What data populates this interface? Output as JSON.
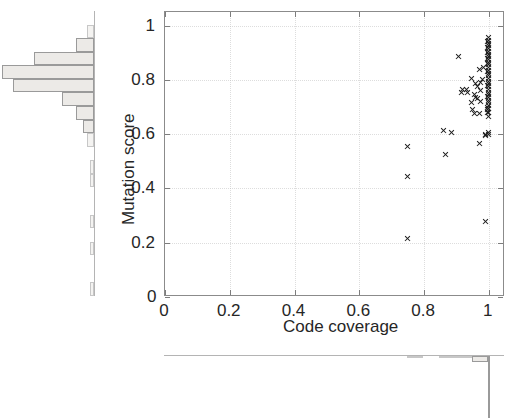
{
  "figure": {
    "name": "code-coverage-vs-mutation-score-scatter-with-marginal-histograms"
  },
  "chart_data": {
    "type": "scatter",
    "title": "",
    "xlabel": "Code coverage",
    "ylabel": "Mutation score",
    "xlim": [
      0,
      1.05
    ],
    "ylim": [
      0,
      1.05
    ],
    "grid": true,
    "legend": null,
    "xticks": [
      "0",
      "0.2",
      "0.4",
      "0.6",
      "0.8",
      "1"
    ],
    "xtick_values": [
      0,
      0.2,
      0.4,
      0.6,
      0.8,
      1
    ],
    "yticks": [
      "0",
      "0.2",
      "0.4",
      "0.6",
      "0.8",
      "1"
    ],
    "ytick_values": [
      0,
      0.2,
      0.4,
      0.6,
      0.8,
      1
    ],
    "marker": "x",
    "marker_color": "#1c1c1c",
    "points": [
      [
        0.75,
        0.215
      ],
      [
        0.75,
        0.445
      ],
      [
        0.75,
        0.555
      ],
      [
        0.865,
        0.525
      ],
      [
        0.86,
        0.615
      ],
      [
        0.885,
        0.605
      ],
      [
        0.905,
        0.885
      ],
      [
        0.92,
        0.765
      ],
      [
        0.915,
        0.755
      ],
      [
        0.93,
        0.765
      ],
      [
        0.935,
        0.755
      ],
      [
        0.945,
        0.805
      ],
      [
        0.945,
        0.715
      ],
      [
        0.95,
        0.69
      ],
      [
        0.955,
        0.675
      ],
      [
        0.955,
        0.745
      ],
      [
        0.96,
        0.735
      ],
      [
        0.96,
        0.785
      ],
      [
        0.965,
        0.775
      ],
      [
        0.965,
        0.73
      ],
      [
        0.97,
        0.84
      ],
      [
        0.97,
        0.675
      ],
      [
        0.97,
        0.565
      ],
      [
        0.975,
        0.79
      ],
      [
        0.975,
        0.76
      ],
      [
        0.975,
        0.72
      ],
      [
        0.98,
        0.8
      ],
      [
        0.985,
        0.845
      ],
      [
        0.99,
        0.6
      ],
      [
        0.99,
        0.595
      ],
      [
        0.99,
        0.28
      ],
      [
        0.995,
        0.68
      ],
      [
        0.995,
        0.69
      ],
      [
        1.0,
        0.6
      ],
      [
        1.0,
        0.605
      ],
      [
        1.0,
        0.665
      ],
      [
        1.0,
        0.68
      ],
      [
        1.0,
        0.695
      ],
      [
        1.0,
        0.705
      ],
      [
        1.0,
        0.715
      ],
      [
        1.0,
        0.725
      ],
      [
        1.0,
        0.735
      ],
      [
        1.0,
        0.745
      ],
      [
        1.0,
        0.755
      ],
      [
        1.0,
        0.765
      ],
      [
        1.0,
        0.775
      ],
      [
        1.0,
        0.785
      ],
      [
        1.0,
        0.795
      ],
      [
        1.0,
        0.805
      ],
      [
        1.0,
        0.815
      ],
      [
        1.0,
        0.825
      ],
      [
        1.0,
        0.835
      ],
      [
        1.0,
        0.845
      ],
      [
        1.0,
        0.855
      ],
      [
        1.0,
        0.865
      ],
      [
        1.0,
        0.875
      ],
      [
        1.0,
        0.885
      ],
      [
        1.0,
        0.895
      ],
      [
        1.0,
        0.905
      ],
      [
        1.0,
        0.915
      ],
      [
        1.0,
        0.925
      ],
      [
        1.0,
        0.935
      ],
      [
        1.0,
        0.945
      ],
      [
        1.0,
        0.955
      ],
      [
        0.995,
        0.83
      ],
      [
        0.995,
        0.92
      ],
      [
        0.995,
        0.94
      ],
      [
        0.995,
        0.9
      ],
      [
        0.995,
        0.88
      ],
      [
        0.995,
        0.86
      ],
      [
        0.995,
        0.78
      ],
      [
        0.995,
        0.74
      ],
      [
        0.995,
        0.7
      ]
    ],
    "y_marginal": {
      "orientation": "horizontal",
      "bin_edges": [
        0.0,
        0.05,
        0.1,
        0.15,
        0.2,
        0.25,
        0.3,
        0.35,
        0.4,
        0.45,
        0.5,
        0.55,
        0.6,
        0.65,
        0.7,
        0.75,
        0.8,
        0.85,
        0.9,
        0.95,
        1.0
      ],
      "counts": [
        1,
        0,
        0,
        1,
        0,
        1,
        0,
        0,
        1,
        1,
        0,
        2,
        3,
        5,
        9,
        23,
        26,
        17,
        5,
        2
      ],
      "max_count": 26
    },
    "x_marginal": {
      "orientation": "vertical",
      "bin_edges": [
        0.0,
        0.05,
        0.1,
        0.15,
        0.2,
        0.25,
        0.3,
        0.35,
        0.4,
        0.45,
        0.5,
        0.55,
        0.6,
        0.65,
        0.7,
        0.75,
        0.8,
        0.85,
        0.9,
        0.95,
        1.0
      ],
      "counts": [
        0,
        0,
        0,
        0,
        0,
        0,
        0,
        0,
        0,
        0,
        0,
        0,
        0,
        0,
        0,
        1,
        0,
        1,
        2,
        6,
        62
      ],
      "max_count": 62
    }
  },
  "axes": {
    "x_title": "Code coverage",
    "y_title": "Mutation score",
    "x_tick_labels": [
      "0",
      "0.2",
      "0.4",
      "0.6",
      "0.8",
      "1"
    ],
    "y_tick_labels": [
      "0",
      "0.2",
      "0.4",
      "0.6",
      "0.8",
      "1"
    ],
    "origin_label": "0"
  }
}
